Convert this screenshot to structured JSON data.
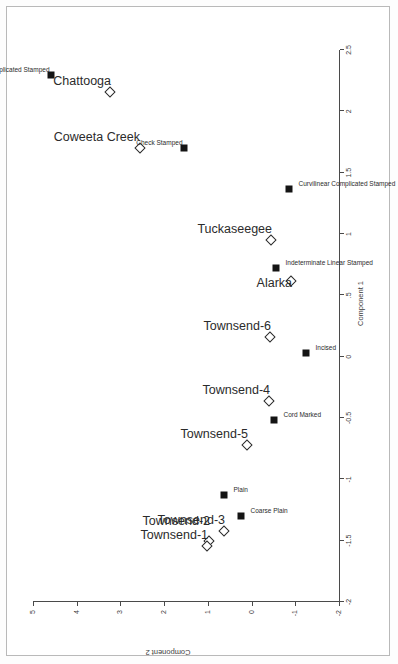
{
  "figure": {
    "orientation": "rotated-90-ccw",
    "background": "#ffffff",
    "frame_color": "#b9b9b9"
  },
  "axes": {
    "x": {
      "title": "Component 1",
      "min": -2,
      "max": 2.5,
      "ticks": [
        -2,
        -1.5,
        -1,
        -0.5,
        0,
        0.5,
        1,
        1.5,
        2,
        2.5
      ],
      "tick_labels": [
        "-2",
        "-1.5",
        "-1",
        "-0.5",
        "0",
        ".5",
        "1",
        "1.5",
        "2",
        "2.5"
      ]
    },
    "y": {
      "title": "Component 2",
      "min": -2,
      "max": 5,
      "ticks": [
        -2,
        -1,
        0,
        1,
        2,
        3,
        4,
        5
      ],
      "tick_labels": [
        "-2",
        "-1",
        "0",
        "1",
        "2",
        "3",
        "4",
        "5"
      ]
    }
  },
  "legend": {
    "site_marker": "open-diamond",
    "type_marker": "filled-square"
  },
  "chart_data": {
    "type": "scatter",
    "title": "",
    "xlabel": "Component 1",
    "ylabel": "Component 2",
    "xlim": [
      -2,
      2.5
    ],
    "ylim": [
      -2,
      5
    ],
    "grid": false,
    "legend_position": "none",
    "series": [
      {
        "name": "Sites",
        "marker": "open-diamond",
        "points": [
          {
            "label": "Chattooga",
            "x": 2.16,
            "y": 3.25,
            "label_dx": -6,
            "label_dy": -4,
            "label_anchor": "end"
          },
          {
            "label": "Coweeta Creek",
            "x": 1.7,
            "y": 2.55,
            "label_dx": -7,
            "label_dy": -4,
            "label_anchor": "end"
          },
          {
            "label": "Tuckaseegee",
            "x": 0.95,
            "y": -0.45,
            "label_dx": -6,
            "label_dy": -4,
            "label_anchor": "end"
          },
          {
            "label": "Alarka",
            "x": 0.62,
            "y": -0.9,
            "label_dx": -6,
            "label_dy": 9,
            "label_anchor": "end"
          },
          {
            "label": "Townsend-6",
            "x": 0.16,
            "y": -0.43,
            "label_dx": -6,
            "label_dy": -4,
            "label_anchor": "end"
          },
          {
            "label": "Townsend-4",
            "x": -0.36,
            "y": -0.4,
            "label_dx": -6,
            "label_dy": -4,
            "label_anchor": "end"
          },
          {
            "label": "Townsend-5",
            "x": -0.72,
            "y": 0.1,
            "label_dx": -6,
            "label_dy": -4,
            "label_anchor": "end"
          },
          {
            "label": "Townsend-3",
            "x": -1.42,
            "y": 0.62,
            "label_dx": -6,
            "label_dy": -4,
            "label_anchor": "end"
          },
          {
            "label": "Townsend-2",
            "x": -1.5,
            "y": 0.98,
            "label_dx": -6,
            "label_dy": -13,
            "label_anchor": "end"
          },
          {
            "label": "Townsend-1",
            "x": -1.54,
            "y": 1.03,
            "label_dx": -6,
            "label_dy": -4,
            "label_anchor": "end"
          }
        ]
      },
      {
        "name": "Pottery types",
        "marker": "filled-square",
        "points": [
          {
            "label": "Rectilinear Complicated Stamped",
            "x": 2.3,
            "y": 4.58,
            "label_dx": -5,
            "label_dy": -2,
            "label_anchor": "end"
          },
          {
            "label": "Check Stamped",
            "x": 1.7,
            "y": 1.55,
            "label_dx": -5,
            "label_dy": -2,
            "label_anchor": "end"
          },
          {
            "label": "Curvilinear Complicated Stamped",
            "x": 1.37,
            "y": -0.85,
            "label_dx": 6,
            "label_dy": -2,
            "label_anchor": "start"
          },
          {
            "label": "Indeterminate Linear Stamped",
            "x": 0.72,
            "y": -0.55,
            "label_dx": 6,
            "label_dy": -2,
            "label_anchor": "start"
          },
          {
            "label": "Incised",
            "x": 0.03,
            "y": -1.25,
            "label_dx": 6,
            "label_dy": -2,
            "label_anchor": "start"
          },
          {
            "label": "Cord Marked",
            "x": -0.52,
            "y": -0.52,
            "label_dx": 6,
            "label_dy": -2,
            "label_anchor": "start"
          },
          {
            "label": "Coarse Plain",
            "x": -1.3,
            "y": 0.24,
            "label_dx": 6,
            "label_dy": -2,
            "label_anchor": "start"
          },
          {
            "label": "Plain",
            "x": -1.13,
            "y": 0.62,
            "label_dx": 6,
            "label_dy": -2,
            "label_anchor": "start"
          }
        ]
      }
    ]
  }
}
